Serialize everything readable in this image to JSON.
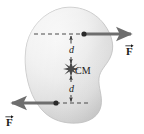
{
  "figure": {
    "type": "physics-free-body-diagram",
    "body": {
      "name": "rigid-body-blob",
      "fill_light": "#f2f2f2",
      "fill_mid": "#dcdcdc",
      "fill_dark": "#c4c4c4",
      "stroke": "#b0b0b0"
    },
    "center_of_mass": {
      "label": "CM",
      "marker": "starburst-icon",
      "marker_color": "#4a4a4a",
      "x": 71,
      "y": 69
    },
    "distances": [
      {
        "label": "d",
        "position": "top",
        "from": "force-line-top",
        "to": "center-of-mass"
      },
      {
        "label": "d",
        "position": "bottom",
        "from": "center-of-mass",
        "to": "force-line-bottom"
      }
    ],
    "forces": [
      {
        "label": "F",
        "vector_accent": "arrow-right",
        "direction": "right",
        "application_point_x": 84,
        "application_point_y": 34,
        "arrow_color": "#6e6e6e",
        "label_x": 126,
        "label_y": 42
      },
      {
        "label": "F",
        "vector_accent": "arrow-right",
        "direction": "left",
        "application_point_x": 56,
        "application_point_y": 103,
        "arrow_color": "#6e6e6e",
        "label_x": 6,
        "label_y": 113
      }
    ],
    "guide_lines": {
      "style": "dashed",
      "color": "#4a4a4a",
      "top_y": 34,
      "bottom_y": 103,
      "vertical_x": 71
    }
  }
}
